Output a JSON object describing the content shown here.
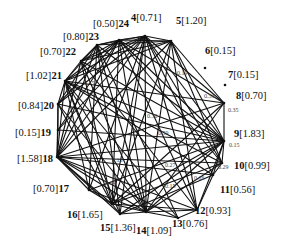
{
  "diagram": {
    "type": "weighted-graph",
    "nodes": [
      {
        "id": "4",
        "value": "[0.71]",
        "x": 145,
        "y": 36,
        "label": {
          "x": 131,
          "y": 13,
          "order": "id-first"
        }
      },
      {
        "id": "5",
        "value": "[1.20]",
        "x": 171,
        "y": 41,
        "label": {
          "x": 176,
          "y": 16,
          "order": "id-first"
        }
      },
      {
        "id": "6",
        "value": "[0.15]",
        "x": 205,
        "y": 68,
        "label": {
          "x": 205,
          "y": 46,
          "order": "id-first"
        }
      },
      {
        "id": "7",
        "value": "[0.15]",
        "x": 225,
        "y": 85,
        "label": {
          "x": 228,
          "y": 70,
          "order": "id-first"
        }
      },
      {
        "id": "8",
        "value": "[0.70]",
        "x": 224,
        "y": 103,
        "label": {
          "x": 236,
          "y": 91,
          "order": "id-first"
        }
      },
      {
        "id": "9",
        "value": "[1.83]",
        "x": 224,
        "y": 141,
        "label": {
          "x": 234,
          "y": 129,
          "order": "id-first"
        }
      },
      {
        "id": "10",
        "value": "[0.99]",
        "x": 222,
        "y": 163,
        "label": {
          "x": 234,
          "y": 161,
          "order": "id-first"
        }
      },
      {
        "id": "11",
        "value": "[0.56]",
        "x": 213,
        "y": 175,
        "label": {
          "x": 220,
          "y": 185,
          "order": "id-first"
        }
      },
      {
        "id": "12",
        "value": "[0.93]",
        "x": 197,
        "y": 210,
        "label": {
          "x": 195,
          "y": 206,
          "order": "id-first"
        }
      },
      {
        "id": "13",
        "value": "[0.76]",
        "x": 178,
        "y": 218,
        "label": {
          "x": 172,
          "y": 219,
          "order": "id-first"
        }
      },
      {
        "id": "14",
        "value": "[1.09]",
        "x": 146,
        "y": 212,
        "label": {
          "x": 136,
          "y": 226,
          "order": "id-first"
        }
      },
      {
        "id": "15",
        "value": "[1.36]",
        "x": 120,
        "y": 214,
        "label": {
          "x": 100,
          "y": 223,
          "order": "id-first"
        }
      },
      {
        "id": "16",
        "value": "[1.65]",
        "x": 112,
        "y": 204,
        "label": {
          "x": 67,
          "y": 210,
          "order": "id-first"
        }
      },
      {
        "id": "17",
        "value": "[0.70]",
        "x": 89,
        "y": 190,
        "label": {
          "x": 33,
          "y": 184,
          "order": "value-first"
        }
      },
      {
        "id": "18",
        "value": "[1.58]",
        "x": 57,
        "y": 157,
        "label": {
          "x": 17,
          "y": 154,
          "order": "value-first"
        }
      },
      {
        "id": "19",
        "value": "[0.15]",
        "x": 58,
        "y": 130,
        "label": {
          "x": 15,
          "y": 128,
          "order": "value-first"
        }
      },
      {
        "id": "20",
        "value": "[0.84]",
        "x": 58,
        "y": 104,
        "label": {
          "x": 18,
          "y": 101,
          "order": "value-first"
        }
      },
      {
        "id": "21",
        "value": "[1.02]",
        "x": 65,
        "y": 81,
        "label": {
          "x": 26,
          "y": 71,
          "order": "value-first"
        }
      },
      {
        "id": "22",
        "value": "[0.70]",
        "x": 81,
        "y": 61,
        "label": {
          "x": 40,
          "y": 47,
          "order": "value-first"
        }
      },
      {
        "id": "23",
        "value": "[0.80]",
        "x": 97,
        "y": 45,
        "label": {
          "x": 63,
          "y": 32,
          "order": "value-first"
        }
      },
      {
        "id": "24",
        "value": "[0.50]",
        "x": 119,
        "y": 40,
        "label": {
          "x": 93,
          "y": 19,
          "order": "value-first"
        }
      }
    ],
    "edge_weights": [
      {
        "text": "0.15",
        "x": 124,
        "y": 37
      },
      {
        "text": "0.15",
        "x": 84,
        "y": 80
      },
      {
        "text": "0.19",
        "x": 177,
        "y": 70
      },
      {
        "text": "0.53",
        "x": 204,
        "y": 93
      },
      {
        "text": "0.35",
        "x": 228,
        "y": 107
      },
      {
        "text": "0.30",
        "x": 147,
        "y": 113
      },
      {
        "text": "0.59",
        "x": 158,
        "y": 130
      },
      {
        "text": "0.15",
        "x": 229,
        "y": 142
      },
      {
        "text": "0.13",
        "x": 112,
        "y": 157
      },
      {
        "text": "0.27",
        "x": 165,
        "y": 162
      },
      {
        "text": "0.29",
        "x": 218,
        "y": 164
      },
      {
        "text": "0.14",
        "x": 105,
        "y": 180
      },
      {
        "text": "0.16",
        "x": 194,
        "y": 175
      },
      {
        "text": "0.15",
        "x": 165,
        "y": 183
      }
    ],
    "edges": [
      [
        "4",
        "24"
      ],
      [
        "4",
        "23"
      ],
      [
        "4",
        "22"
      ],
      [
        "4",
        "21"
      ],
      [
        "4",
        "20"
      ],
      [
        "4",
        "19"
      ],
      [
        "4",
        "18"
      ],
      [
        "4",
        "17"
      ],
      [
        "4",
        "16"
      ],
      [
        "4",
        "15"
      ],
      [
        "4",
        "14"
      ],
      [
        "4",
        "9"
      ],
      [
        "4",
        "10"
      ],
      [
        "4",
        "11"
      ],
      [
        "4",
        "12"
      ],
      [
        "4",
        "8"
      ],
      [
        "4",
        "5"
      ],
      [
        "5",
        "24"
      ],
      [
        "5",
        "23"
      ],
      [
        "5",
        "22"
      ],
      [
        "5",
        "21"
      ],
      [
        "5",
        "18"
      ],
      [
        "5",
        "16"
      ],
      [
        "5",
        "14"
      ],
      [
        "5",
        "9"
      ],
      [
        "5",
        "10"
      ],
      [
        "5",
        "8"
      ],
      [
        "5",
        "12"
      ],
      [
        "8",
        "9"
      ],
      [
        "8",
        "24"
      ],
      [
        "8",
        "21"
      ],
      [
        "8",
        "18"
      ],
      [
        "8",
        "16"
      ],
      [
        "8",
        "14"
      ],
      [
        "9",
        "24"
      ],
      [
        "9",
        "23"
      ],
      [
        "9",
        "22"
      ],
      [
        "9",
        "21"
      ],
      [
        "9",
        "20"
      ],
      [
        "9",
        "19"
      ],
      [
        "9",
        "18"
      ],
      [
        "9",
        "17"
      ],
      [
        "9",
        "16"
      ],
      [
        "9",
        "15"
      ],
      [
        "9",
        "14"
      ],
      [
        "9",
        "12"
      ],
      [
        "9",
        "10"
      ],
      [
        "9",
        "11"
      ],
      [
        "10",
        "21"
      ],
      [
        "10",
        "18"
      ],
      [
        "10",
        "16"
      ],
      [
        "10",
        "14"
      ],
      [
        "10",
        "11"
      ],
      [
        "10",
        "24"
      ],
      [
        "11",
        "12"
      ],
      [
        "11",
        "18"
      ],
      [
        "11",
        "21"
      ],
      [
        "11",
        "15"
      ],
      [
        "12",
        "13"
      ],
      [
        "12",
        "18"
      ],
      [
        "12",
        "14"
      ],
      [
        "12",
        "16"
      ],
      [
        "12",
        "22"
      ],
      [
        "12",
        "24"
      ],
      [
        "13",
        "14"
      ],
      [
        "13",
        "18"
      ],
      [
        "13",
        "21"
      ],
      [
        "13",
        "23"
      ],
      [
        "14",
        "15"
      ],
      [
        "14",
        "16"
      ],
      [
        "14",
        "17"
      ],
      [
        "14",
        "18"
      ],
      [
        "14",
        "20"
      ],
      [
        "14",
        "21"
      ],
      [
        "14",
        "22"
      ],
      [
        "14",
        "23"
      ],
      [
        "14",
        "24"
      ],
      [
        "15",
        "16"
      ],
      [
        "15",
        "18"
      ],
      [
        "15",
        "21"
      ],
      [
        "15",
        "23"
      ],
      [
        "16",
        "17"
      ],
      [
        "16",
        "18"
      ],
      [
        "16",
        "20"
      ],
      [
        "16",
        "21"
      ],
      [
        "16",
        "22"
      ],
      [
        "16",
        "24"
      ],
      [
        "17",
        "18"
      ],
      [
        "17",
        "21"
      ],
      [
        "17",
        "23"
      ],
      [
        "18",
        "19"
      ],
      [
        "18",
        "20"
      ],
      [
        "18",
        "21"
      ],
      [
        "18",
        "22"
      ],
      [
        "18",
        "23"
      ],
      [
        "18",
        "24"
      ],
      [
        "19",
        "20"
      ],
      [
        "19",
        "24"
      ],
      [
        "20",
        "21"
      ],
      [
        "20",
        "23"
      ],
      [
        "20",
        "24"
      ],
      [
        "21",
        "22"
      ],
      [
        "21",
        "23"
      ],
      [
        "21",
        "24"
      ],
      [
        "22",
        "23"
      ],
      [
        "22",
        "24"
      ],
      [
        "23",
        "24"
      ]
    ]
  }
}
